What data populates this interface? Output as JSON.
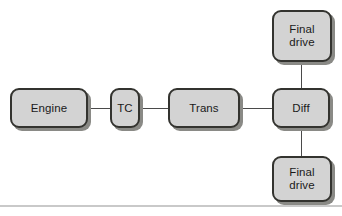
{
  "diagram": {
    "canvas": {
      "width": 342,
      "height": 216,
      "background": "#ffffff"
    },
    "style": {
      "block_fill": "#d3d3d3",
      "block_border": "#33332f",
      "block_shadow": "#8a8a86",
      "connector_color": "#4a4a4a",
      "rule_color": "#c9c9c9",
      "text_color": "#1a1a1a"
    },
    "nodes": [
      {
        "id": "engine",
        "label": "Engine",
        "name": "block-engine"
      },
      {
        "id": "tc",
        "label": "TC",
        "name": "block-tc"
      },
      {
        "id": "trans",
        "label": "Trans",
        "name": "block-trans"
      },
      {
        "id": "diff",
        "label": "Diff",
        "name": "block-diff"
      },
      {
        "id": "fd_top",
        "label": "Final\ndrive",
        "name": "block-final-drive-top"
      },
      {
        "id": "fd_bottom",
        "label": "Final\ndrive",
        "name": "block-final-drive-bottom"
      }
    ],
    "connections": [
      {
        "id": "engine_tc",
        "from": "engine",
        "to": "tc",
        "orientation": "horizontal"
      },
      {
        "id": "tc_trans",
        "from": "tc",
        "to": "trans",
        "orientation": "horizontal"
      },
      {
        "id": "trans_diff",
        "from": "trans",
        "to": "diff",
        "orientation": "horizontal"
      },
      {
        "id": "fdtop_diff",
        "from": "fd_top",
        "to": "diff",
        "orientation": "vertical"
      },
      {
        "id": "diff_fdbot",
        "from": "diff",
        "to": "fd_bottom",
        "orientation": "vertical"
      }
    ]
  }
}
